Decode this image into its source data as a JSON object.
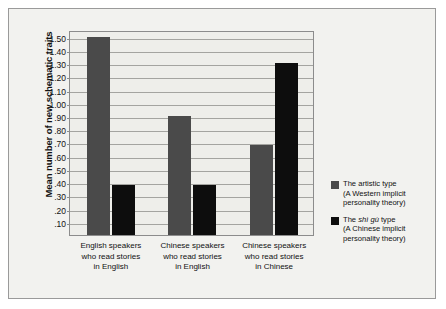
{
  "chart_data": {
    "type": "bar",
    "title": "",
    "xlabel": "",
    "ylabel": "Mean number of new schematic traits",
    "ylim": [
      0.0,
      1.55
    ],
    "ytick_step": 0.1,
    "ytick_labels": [
      "1.50",
      "1.40",
      "1.30",
      "1.20",
      "1.10",
      "1.00",
      ".90",
      ".80",
      ".70",
      ".60",
      ".50",
      ".40",
      ".30",
      ".20",
      ".10"
    ],
    "ytick_values": [
      1.5,
      1.4,
      1.3,
      1.2,
      1.1,
      1.0,
      0.9,
      0.8,
      0.7,
      0.6,
      0.5,
      0.4,
      0.3,
      0.2,
      0.1
    ],
    "grid": true,
    "legend_position": "right",
    "categories": [
      "English speakers who read stories in English",
      "Chinese speakers who read stories in English",
      "Chinese speakers who read stories in Chinese"
    ],
    "category_lines": [
      [
        "English speakers",
        "who read stories",
        "in English"
      ],
      [
        "Chinese speakers",
        "who read stories",
        "in English"
      ],
      [
        "Chinese speakers",
        "who read stories",
        "in Chinese"
      ]
    ],
    "series": [
      {
        "name": "The artistic type (A Western implicit personality theory)",
        "color": "#4a4a4a",
        "values": [
          1.5,
          0.9,
          0.68
        ]
      },
      {
        "name": "The shì gù type (A Chinese implicit personality theory)",
        "color": "#0d0d0d",
        "values": [
          0.38,
          0.38,
          1.3
        ]
      }
    ]
  },
  "legend": {
    "entries": [
      {
        "line1_pre": "The artistic type",
        "line1_term": "",
        "line1_post": "",
        "line2": "(A Western implicit",
        "line3": "personality theory)"
      },
      {
        "line1_pre": "The ",
        "line1_term": "shì gù",
        "line1_post": " type",
        "line2": "(A Chinese implicit",
        "line3": "personality theory)"
      }
    ]
  }
}
